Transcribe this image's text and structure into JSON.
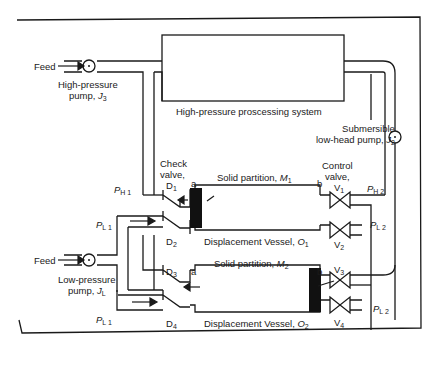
{
  "diagram": {
    "labels": {
      "feed_top": "Feed",
      "hp_pump_line1": "High-pressure",
      "hp_pump_line2": "pump,",
      "hp_pump_symbol": "J",
      "hp_pump_sub": "3",
      "processing_system": "High-pressure proscessing system",
      "sub_pump_line1": "Submersible",
      "sub_pump_line2": "low-head pump,",
      "sub_pump_symbol": "J",
      "sub_pump_sub": "2",
      "check_valve_line1": "Check",
      "check_valve_line2": "valve,",
      "d1": "D",
      "d1_sub": "1",
      "d2": "D",
      "d2_sub": "2",
      "d3": "D",
      "d3_sub": "3",
      "d4": "D",
      "d4_sub": "4",
      "a1": "a",
      "b1": "b",
      "a2": "a",
      "b2": "b",
      "partition1": "Solid partition,",
      "partition1_symbol": "M",
      "partition1_sub": "1",
      "partition2": "Solid partition,",
      "partition2_symbol": "M",
      "partition2_sub": "2",
      "control_valve_line1": "Control",
      "control_valve_line2": "valve,",
      "v1": "V",
      "v1_sub": "1",
      "v2": "V",
      "v2_sub": "2",
      "v3": "V",
      "v3_sub": "3",
      "v4": "V",
      "v4_sub": "4",
      "ph1": "P",
      "ph1_sub": "H 1",
      "pl1_top": "P",
      "pl1_top_sub": "L 1",
      "pl1_bottom": "P",
      "pl1_bottom_sub": "L 1",
      "ph2": "P",
      "ph2_sub": "H 2",
      "pl2_top": "P",
      "pl2_top_sub": "L 2",
      "pl2_bottom": "P",
      "pl2_bottom_sub": "L 2",
      "vessel1": "Displacement Vessel,",
      "vessel1_symbol": "O",
      "vessel1_sub": "1",
      "vessel2": "Displacement Vessel,",
      "vessel2_symbol": "O",
      "vessel2_sub": "2",
      "feed_bottom": "Feed",
      "lp_pump_line1": "Low-pressure",
      "lp_pump_line2": "pump,",
      "lp_pump_symbol": "J",
      "lp_pump_sub": "L"
    },
    "colors": {
      "line": "#1a1a1a",
      "partition": "#111111",
      "background": "#ffffff"
    }
  }
}
